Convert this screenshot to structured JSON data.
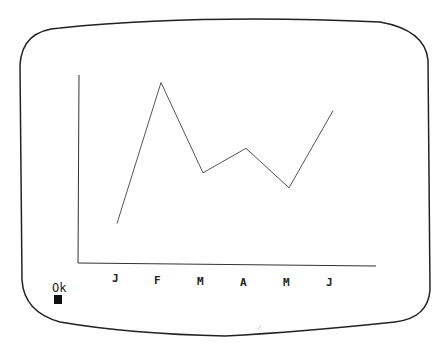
{
  "screen": {
    "prompt_text": "Ok",
    "cursor": "block-cursor"
  },
  "chart_data": {
    "type": "line",
    "title": "",
    "xlabel": "",
    "ylabel": "",
    "categories": [
      "J",
      "F",
      "M",
      "A",
      "M",
      "J"
    ],
    "values": [
      21,
      96,
      48,
      61,
      40,
      81
    ],
    "ylim": [
      0,
      100
    ],
    "grid": false,
    "legend": null
  },
  "labels": {
    "x0": "J",
    "x1": "F",
    "x2": "M",
    "x3": "A",
    "x4": "M",
    "x5": "J"
  },
  "colors": {
    "line": "#555555",
    "axis": "#333333",
    "frame": "#222222",
    "background": "#ffffff"
  }
}
